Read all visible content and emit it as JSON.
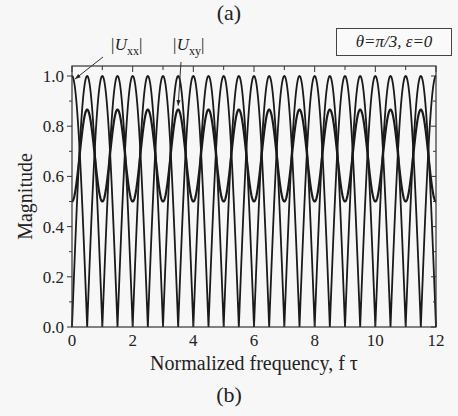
{
  "panel_labels": {
    "top": "(a)",
    "bottom": "(b)"
  },
  "chart_data": {
    "type": "line",
    "title": "",
    "parameter_box": "θ=π/3, ε=0",
    "xlabel": "Normalized frequency, f τ",
    "ylabel": "Magnitude",
    "xlim": [
      0,
      12
    ],
    "ylim": [
      0,
      1.05
    ],
    "xticks": [
      0,
      2,
      4,
      6,
      8,
      10,
      12
    ],
    "xtick_labels": [
      "0",
      "2",
      "4",
      "6",
      "8",
      "10",
      "12"
    ],
    "xminor": [
      1,
      3,
      5,
      7,
      9,
      11
    ],
    "yticks": [
      0.0,
      0.2,
      0.4,
      0.6,
      0.8,
      1.0
    ],
    "ytick_labels": [
      "0.0",
      "0.2",
      "0.4",
      "0.6",
      "0.8",
      "1.0"
    ],
    "yminor": [
      0.1,
      0.3,
      0.5,
      0.7,
      0.9
    ],
    "grid": false,
    "series": [
      {
        "name": "|Uxx|",
        "description": "full-range oscillation between 0 and 1, value 1 at fτ=0, period 1",
        "min": 0.0,
        "max": 1.0,
        "value_at_0": 1.0
      },
      {
        "name": "|Uxx| complementary branch",
        "description": "full-range oscillation between 0 and 1, value 0 at fτ=0, period 1",
        "min": 0.0,
        "max": 1.0,
        "value_at_0": 0.0
      },
      {
        "name": "|Uxy|",
        "description": "oscillation between 0.5 and 0.866, period 1",
        "min": 0.5,
        "max": 0.866
      }
    ],
    "annotations": [
      {
        "label": "|U",
        "sub": "xx",
        "close": "|",
        "points_to_x": 0.0,
        "points_to_y": 1.0
      },
      {
        "label": "|U",
        "sub": "xy",
        "close": "|",
        "points_to_x": 3.5,
        "points_to_y": 0.866
      }
    ]
  }
}
